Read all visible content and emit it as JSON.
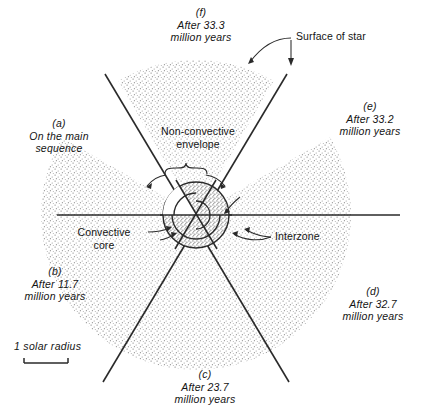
{
  "figure": {
    "name": "stellar-evolution-sector-diagram",
    "background_color": "#ffffff",
    "ink_color": "#141414",
    "stipple_color": "#9a9a9a",
    "core_fill_color": "#b9b9b9"
  },
  "stage_labels": [
    {
      "key": "a",
      "tag": "(a)",
      "line1": "On the main",
      "line2": "sequence",
      "position": "left"
    },
    {
      "key": "b",
      "tag": "(b)",
      "line1": "After 11.7",
      "line2": "million years",
      "position": "lower-left"
    },
    {
      "key": "c",
      "tag": "(c)",
      "line1": "After 23.7",
      "line2": "million years",
      "position": "bottom"
    },
    {
      "key": "d",
      "tag": "(d)",
      "line1": "After 32.7",
      "line2": "million years",
      "position": "lower-right"
    },
    {
      "key": "e",
      "tag": "(e)",
      "line1": "After 33.2",
      "line2": "million years",
      "position": "upper-right"
    },
    {
      "key": "f",
      "tag": "(f)",
      "line1": "After 33.3",
      "line2": "million years",
      "position": "top"
    }
  ],
  "annotations": {
    "surface_of_star": "Surface of star",
    "non_convective_envelope_line1": "Non-convective",
    "non_convective_envelope_line2": "envelope",
    "convective_core_line1": "Convective",
    "convective_core_line2": "core",
    "interzone": "Interzone"
  },
  "scale": {
    "label": "1 solar radius"
  }
}
